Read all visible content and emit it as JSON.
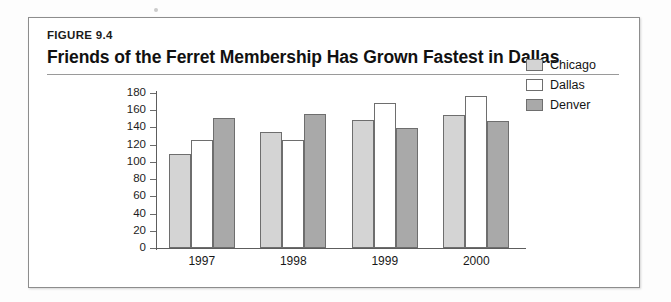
{
  "figure": {
    "label": "FIGURE 9.4",
    "title": "Friends of the Ferret Membership Has Grown Fastest in Dallas"
  },
  "chart_data": {
    "type": "bar",
    "title": "Friends of the Ferret Membership Has Grown Fastest in Dallas",
    "xlabel": "",
    "ylabel": "",
    "categories": [
      "1997",
      "1998",
      "1999",
      "2000"
    ],
    "series": [
      {
        "name": "Chicago",
        "color": "#d4d4d4",
        "values": [
          109,
          135,
          149,
          155
        ]
      },
      {
        "name": "Dallas",
        "color": "#ffffff",
        "values": [
          126,
          126,
          168,
          177
        ]
      },
      {
        "name": "Denver",
        "color": "#a9a9a9",
        "values": [
          151,
          156,
          139,
          148
        ]
      }
    ],
    "ylim": [
      0,
      180
    ],
    "ytick_labels": [
      "180",
      "160",
      "140",
      "120",
      "100",
      "80",
      "60",
      "40",
      "20",
      "0"
    ],
    "ytick_values": [
      180,
      160,
      140,
      120,
      100,
      80,
      60,
      40,
      20,
      0
    ],
    "grid": false,
    "legend_position": "right"
  }
}
